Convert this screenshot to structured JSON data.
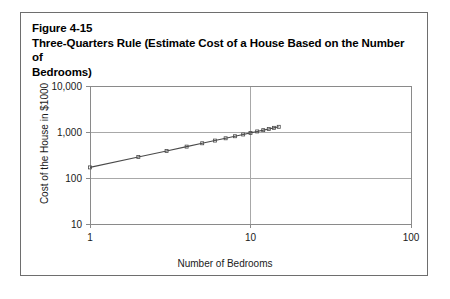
{
  "figure": {
    "number": "Figure 4-15",
    "title": "Three-Quarters Rule (Estimate Cost of a House Based on the Number of",
    "title_line2": "Bedrooms)"
  },
  "chart_data": {
    "type": "line",
    "title": "Three-Quarters Rule (Estimate Cost of a House Based on the Number of Bedrooms)",
    "xlabel": "Number of Bedrooms",
    "ylabel": "Cost of the House in $1000",
    "xscale": "log",
    "yscale": "log",
    "xlim": [
      1,
      100
    ],
    "ylim": [
      10,
      10000
    ],
    "xticks": [
      "1",
      "10",
      "100"
    ],
    "xtick_values": [
      1,
      10,
      100
    ],
    "yticks": [
      "10",
      "100",
      "1,000",
      "10,000"
    ],
    "ytick_values": [
      10,
      100,
      1000,
      10000
    ],
    "grid": true,
    "legend": "none",
    "marker": "small-square",
    "line_color": "#4a4a4a",
    "grid_color": "#a8a8a8",
    "axis_color": "#8a8a8a",
    "x": [
      1,
      2,
      3,
      4,
      5,
      6,
      7,
      8,
      9,
      10,
      11,
      12,
      13,
      14,
      15
    ],
    "values": [
      170,
      286,
      387,
      481,
      569,
      651,
      730,
      809,
      883,
      956,
      1028,
      1097,
      1165,
      1231,
      1296
    ],
    "series": [
      {
        "name": "Cost of the House in $1000",
        "x": [
          1,
          2,
          3,
          4,
          5,
          6,
          7,
          8,
          9,
          10,
          11,
          12,
          13,
          14,
          15
        ],
        "values": [
          170,
          286,
          387,
          481,
          569,
          651,
          730,
          809,
          883,
          956,
          1028,
          1097,
          1165,
          1231,
          1296
        ]
      }
    ]
  },
  "colors": {
    "frame_border": "#6e6e6e",
    "text": "#000000",
    "plot_line": "#4a4a4a",
    "grid": "#a8a8a8"
  }
}
